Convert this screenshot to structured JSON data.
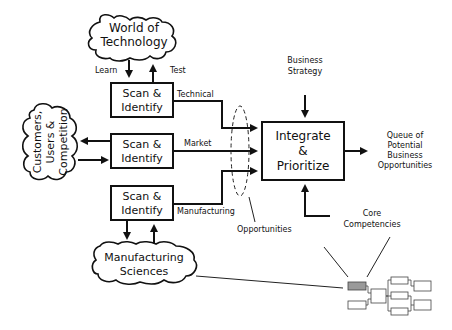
{
  "diagram": {
    "clouds": {
      "technology": [
        "World of",
        "Technology"
      ],
      "customers": [
        "Customers,",
        "Users &",
        "Competition"
      ],
      "manufacturing": [
        "Manufacturing",
        "Sciences"
      ]
    },
    "scan_boxes": [
      {
        "line1": "Scan &",
        "line2": "Identify",
        "output_label": "Technical"
      },
      {
        "line1": "Scan &",
        "line2": "Identify",
        "output_label": "Market"
      },
      {
        "line1": "Scan &",
        "line2": "Identify",
        "output_label": "Manufacturing"
      }
    ],
    "tech_arrows": {
      "learn": "Learn",
      "test": "Test"
    },
    "integrate_box": [
      "Integrate",
      "&",
      "Prioritize"
    ],
    "business_strategy": [
      "Business",
      "Strategy"
    ],
    "core_competencies": [
      "Core",
      "Competencies"
    ],
    "queue": [
      "Queue of",
      "Potential",
      "Business",
      "Opportunities"
    ],
    "opportunities_label": "Opportunities"
  }
}
